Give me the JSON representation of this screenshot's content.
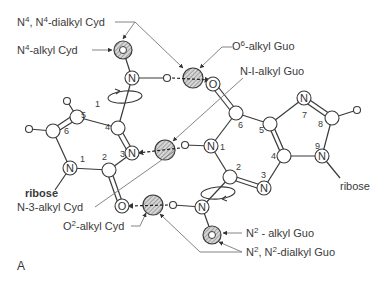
{
  "figure": {
    "panel_label": "A"
  },
  "cytidine": {
    "name": "Cyd",
    "ring_numbers": [
      "1",
      "2",
      "3",
      "4",
      "5",
      "6"
    ],
    "sugar": "ribose",
    "atoms": {
      "N1": "N",
      "N3": "N",
      "N4": "N",
      "O2": "O"
    }
  },
  "guanosine": {
    "name": "Guo",
    "ring_numbers": [
      "1",
      "2",
      "3",
      "4",
      "5",
      "6",
      "7",
      "8",
      "9"
    ],
    "sugar": "ribose",
    "atoms": {
      "N1": "N",
      "N3": "N",
      "N7": "N",
      "N9": "N",
      "N2": "N",
      "O6": "O"
    }
  },
  "labels": {
    "n4_n4_dialkyl_cyd": {
      "base": "N",
      "sup1": "4",
      "mid": ", N",
      "sup2": "4",
      "rest": "-dialkyl  Cyd"
    },
    "n4_alkyl_cyd": {
      "base": "N",
      "sup": "4",
      "rest": "-alkyl  Cyd"
    },
    "o6_alkyl_guo": {
      "base": "O",
      "sup": "6",
      "rest": "-alkyl  Guo"
    },
    "n1_alkyl_guo": {
      "text": "N-I-alkyl  Guo"
    },
    "n3_alkyl_cyd": {
      "text": "N-3-alkyl  Cyd"
    },
    "o2_alkyl_cyd": {
      "base": "O",
      "sup": "2",
      "rest": "-alkyl  Cyd"
    },
    "n2_alkyl_guo": {
      "base": "N",
      "sup": "2",
      "rest": " - alkyl  Guo"
    },
    "n2_n2_dialkyl_guo": {
      "base": "N",
      "sup1": "2",
      "mid": ", N",
      "sup2": "2",
      "rest": "-dialkyl  Guo"
    }
  },
  "colors": {
    "line": "#3a3a3a",
    "leader": "#777777",
    "shade": "#bdbdbd",
    "background": "#ffffff"
  }
}
